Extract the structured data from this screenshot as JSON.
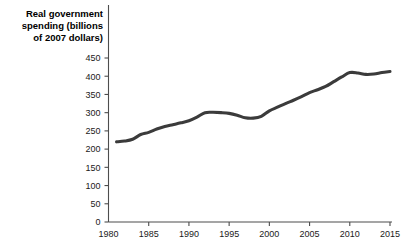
{
  "chart_data": {
    "type": "line",
    "title": "Real government spending (billions of 2007 dollars)",
    "title_lines": [
      "Real government",
      "spending (billions",
      "of 2007 dollars)"
    ],
    "xlabel": "",
    "ylabel": "Real government spending (billions of 2007 dollars)",
    "xlim": [
      1980,
      2015
    ],
    "ylim": [
      0,
      450
    ],
    "x_ticks": [
      1980,
      1985,
      1990,
      1995,
      2000,
      2005,
      2010,
      2015
    ],
    "x_tick_labels": [
      "1980",
      "1985",
      "1990",
      "1995",
      "2000",
      "2005",
      "2010",
      "2015"
    ],
    "y_ticks": [
      0,
      50,
      100,
      150,
      200,
      250,
      300,
      350,
      400,
      450
    ],
    "y_tick_labels": [
      "0",
      "50",
      "100",
      "150",
      "200",
      "250",
      "300",
      "350",
      "400",
      "450"
    ],
    "grid": false,
    "legend": false,
    "legend_position": "none",
    "line_color": "#3b3b3b",
    "line_width": 3.1,
    "axis_color": "#4d4d4d",
    "background_color": "#ffffff",
    "series": [
      {
        "name": "Real government spending",
        "x": [
          1981,
          1982,
          1983,
          1984,
          1985,
          1986,
          1987,
          1988,
          1989,
          1990,
          1991,
          1992,
          1993,
          1994,
          1995,
          1996,
          1997,
          1998,
          1999,
          2000,
          2001,
          2002,
          2003,
          2004,
          2005,
          2006,
          2007,
          2008,
          2009,
          2010,
          2011,
          2012,
          2013,
          2014,
          2015
        ],
        "values": [
          220,
          222,
          227,
          240,
          246,
          255,
          262,
          267,
          272,
          278,
          288,
          300,
          301,
          300,
          298,
          293,
          286,
          285,
          290,
          305,
          315,
          325,
          334,
          344,
          355,
          363,
          372,
          385,
          398,
          410,
          409,
          405,
          406,
          410,
          413
        ]
      }
    ]
  }
}
